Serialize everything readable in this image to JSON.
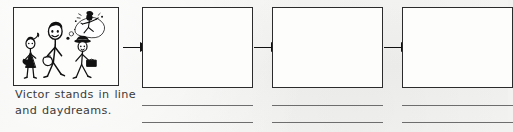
{
  "worksheet": {
    "type": "sequence-storyboard",
    "panel_count": 4,
    "background_color": "#f2f2f0",
    "ink_color": "#2b2b2b",
    "rule_line_color": "#6d6d6d"
  },
  "panels": [
    {
      "index": 1,
      "kind": "illustrated",
      "caption_line_1": "Victor stands in line",
      "caption_line_2": "and daydreams.",
      "illustration": {
        "name": "victor-in-line-daydreaming",
        "description": "Stick figures waiting in a line; the tallest figure has a thought bubble containing a dancing figure",
        "figures": [
          "girl-with-ponytail",
          "tall-boy-victor",
          "man-with-briefcase"
        ],
        "thought_bubble_contents": "dancing-figure"
      },
      "has_rule_lines": false
    },
    {
      "index": 2,
      "kind": "blank",
      "caption_line_1": "",
      "caption_line_2": "",
      "has_rule_lines": true,
      "rule_line_count": 2
    },
    {
      "index": 3,
      "kind": "blank",
      "caption_line_1": "",
      "caption_line_2": "",
      "has_rule_lines": true,
      "rule_line_count": 2
    },
    {
      "index": 4,
      "kind": "blank",
      "caption_line_1": "",
      "caption_line_2": "",
      "has_rule_lines": true,
      "rule_line_count": 2
    }
  ],
  "arrows": [
    {
      "index": 1,
      "from_panel": 1,
      "to_panel": 2,
      "direction": "right"
    },
    {
      "index": 2,
      "from_panel": 2,
      "to_panel": 3,
      "direction": "right"
    },
    {
      "index": 3,
      "from_panel": 3,
      "to_panel": 4,
      "direction": "right"
    }
  ]
}
